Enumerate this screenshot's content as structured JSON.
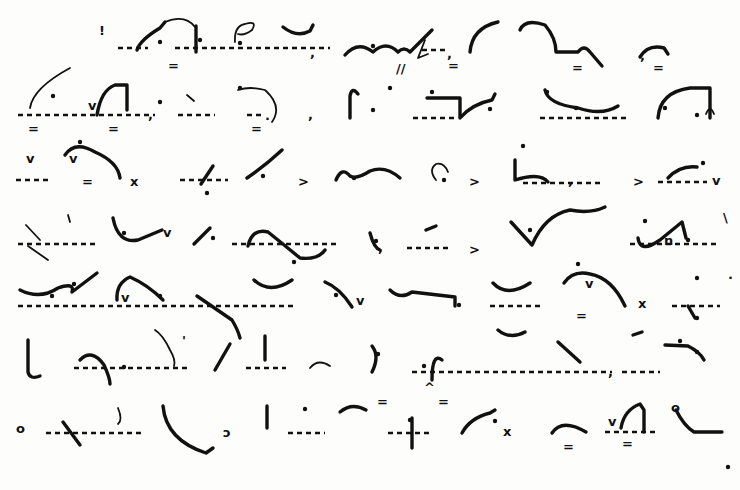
{
  "document": {
    "type": "Pitman shorthand page (scanned)",
    "ink_color": "#111111",
    "paper_color": "#fdfdfc",
    "line_count": 7
  },
  "lines": [
    {
      "id": 1,
      "baselines": [
        [
          118,
          48,
          148,
          48
        ],
        [
          175,
          48,
          330,
          48
        ],
        [
          422,
          50,
          448,
          50
        ]
      ],
      "paths": [
        {
          "d": "M137 50 Q140 40 160 28 L165 22",
          "w": "thick"
        },
        {
          "d": "M165 22 Q185 14 195 27",
          "w": "thin"
        },
        {
          "d": "M196 26 L196 52",
          "w": "thick"
        },
        {
          "d": "M235 42 Q234 26 245 24 Q258 20 252 30 Q244 36 238 34",
          "w": "thin"
        },
        {
          "d": "M283 27 Q297 38 310 31 L313 25",
          "w": "thick"
        },
        {
          "d": "M345 55 Q358 40 373 52 Q386 40 398 52 Q404 46 410 52 L432 30",
          "w": "thick"
        },
        {
          "d": "M425 40 L418 58 L428 54",
          "w": "thin"
        },
        {
          "d": "M470 52 Q472 28 498 22",
          "w": "thick"
        },
        {
          "d": "M520 30 Q525 18 545 25 Q556 38 556 52 L578 52 Q584 44 590 52 L602 66",
          "w": "thick"
        },
        {
          "d": "M640 57 Q648 44 664 48 L668 54",
          "w": "thick"
        }
      ],
      "dots": [
        [
          160,
          42
        ],
        [
          200,
          40
        ],
        [
          240,
          43
        ],
        [
          373,
          46
        ]
      ],
      "marks": [
        {
          "t": "=",
          "x": 168,
          "y": 70
        },
        {
          "t": "//",
          "x": 396,
          "y": 73
        },
        {
          "t": "=",
          "x": 448,
          "y": 70
        },
        {
          "t": "=",
          "x": 572,
          "y": 72
        },
        {
          "t": "=",
          "x": 653,
          "y": 72
        },
        {
          "t": ",",
          "x": 310,
          "y": 57
        },
        {
          "t": ",",
          "x": 447,
          "y": 58
        },
        {
          "t": ",",
          "x": 640,
          "y": 60
        },
        {
          "t": "!",
          "x": 99,
          "y": 35
        }
      ]
    },
    {
      "id": 2,
      "baselines": [
        [
          18,
          115,
          155,
          115
        ],
        [
          178,
          115,
          215,
          115
        ],
        [
          413,
          118,
          456,
          118
        ],
        [
          540,
          118,
          630,
          118
        ],
        [
          247,
          115,
          262,
          115
        ]
      ],
      "paths": [
        {
          "d": "M30 108 Q33 88 70 68",
          "w": "thin"
        },
        {
          "d": "M97 115 Q101 90 115 85 L127 85 L127 110",
          "w": "thick"
        },
        {
          "d": "M187 95 L194 101",
          "w": "thin"
        },
        {
          "d": "M238 90 Q250 86 265 90 Q283 106 272 122",
          "w": "thin"
        },
        {
          "d": "M350 118 L350 96 Q352 86 358 94",
          "w": "thick"
        },
        {
          "d": "M427 98 L460 98 L460 118 Q472 104 492 100 L495 94",
          "w": "thick"
        },
        {
          "d": "M545 90 Q548 104 578 108 Q602 116 618 106",
          "w": "thick"
        },
        {
          "d": "M658 118 Q660 92 690 88 L710 88 L710 118",
          "w": "thick"
        },
        {
          "d": "M706 114 Q710 104 714 114",
          "w": "thin"
        }
      ],
      "dots": [
        [
          53,
          96
        ],
        [
          160,
          102
        ],
        [
          240,
          88
        ],
        [
          373,
          110
        ],
        [
          390,
          88
        ],
        [
          432,
          92
        ],
        [
          490,
          109
        ],
        [
          547,
          92
        ],
        [
          576,
          108
        ],
        [
          665,
          108
        ],
        [
          697,
          115
        ]
      ],
      "marks": [
        {
          "t": "v",
          "x": 88,
          "y": 110
        },
        {
          "t": ",",
          "x": 148,
          "y": 119
        },
        {
          "t": ",",
          "x": 308,
          "y": 119
        },
        {
          "t": "=",
          "x": 28,
          "y": 133
        },
        {
          "t": "=",
          "x": 108,
          "y": 133
        },
        {
          "t": "=",
          "x": 251,
          "y": 133
        },
        {
          "t": ".",
          "x": 265,
          "y": 120
        }
      ]
    },
    {
      "id": 3,
      "baselines": [
        [
          16,
          180,
          48,
          180
        ],
        [
          180,
          180,
          228,
          180
        ],
        [
          523,
          183,
          600,
          183
        ],
        [
          658,
          182,
          707,
          182
        ]
      ],
      "paths": [
        {
          "d": "M65 155 Q75 140 95 152 Q118 162 120 178",
          "w": "thick"
        },
        {
          "d": "M201 184 L213 166",
          "w": "thick"
        },
        {
          "d": "M247 178 Q266 165 282 150",
          "w": "thick"
        },
        {
          "d": "M336 180 Q342 166 350 176 Q356 180 370 171 Q385 165 400 178",
          "w": "thick"
        },
        {
          "d": "M436 180 Q428 170 436 164 Q444 162 448 172",
          "w": "thin"
        },
        {
          "d": "M515 160 L515 180 Q540 172 548 182",
          "w": "thick"
        },
        {
          "d": "M668 178 Q680 165 697 167",
          "w": "thick"
        }
      ],
      "dots": [
        [
          80,
          142
        ],
        [
          207,
          193
        ],
        [
          263,
          176
        ],
        [
          354,
          178
        ],
        [
          444,
          180
        ],
        [
          523,
          146
        ],
        [
          703,
          163
        ]
      ],
      "marks": [
        {
          "t": "v",
          "x": 26,
          "y": 163
        },
        {
          "t": "v",
          "x": 69,
          "y": 163
        },
        {
          "t": "=",
          "x": 82,
          "y": 186
        },
        {
          "t": "x",
          "x": 130,
          "y": 186
        },
        {
          "t": ">",
          "x": 298,
          "y": 186
        },
        {
          "t": ">",
          "x": 469,
          "y": 186
        },
        {
          "t": ",",
          "x": 568,
          "y": 185
        },
        {
          "t": ">",
          "x": 633,
          "y": 186
        },
        {
          "t": "v",
          "x": 712,
          "y": 185
        }
      ]
    },
    {
      "id": 4,
      "baselines": [
        [
          18,
          244,
          98,
          244
        ],
        [
          232,
          244,
          337,
          244
        ],
        [
          407,
          248,
          450,
          248
        ],
        [
          630,
          244,
          720,
          244
        ]
      ],
      "paths": [
        {
          "d": "M28 246 L48 260",
          "w": "thin"
        },
        {
          "d": "M26 225 L40 240",
          "w": "thin"
        },
        {
          "d": "M68 215 L70 222",
          "w": "thin"
        },
        {
          "d": "M113 218 Q118 244 138 240 L162 230",
          "w": "thick"
        },
        {
          "d": "M194 244 L210 228",
          "w": "thick"
        },
        {
          "d": "M248 246 Q252 228 268 232 Q283 244 300 258 Q318 260 325 250",
          "w": "thick"
        },
        {
          "d": "M370 233 Q374 248 380 250",
          "w": "thick"
        },
        {
          "d": "M426 230 L436 226",
          "w": "thick"
        },
        {
          "d": "M511 222 L532 245 Q545 215 570 210 Q590 214 605 207",
          "w": "thick"
        },
        {
          "d": "M638 238 Q640 254 660 240 L682 222 L686 238",
          "w": "thick"
        }
      ],
      "dots": [
        [
          124,
          233
        ],
        [
          213,
          238
        ],
        [
          294,
          262
        ],
        [
          376,
          241
        ],
        [
          530,
          230
        ],
        [
          645,
          221
        ],
        [
          688,
          240
        ]
      ],
      "marks": [
        {
          "t": "v",
          "x": 163,
          "y": 237
        },
        {
          "t": ",",
          "x": 378,
          "y": 252
        },
        {
          "t": ">",
          "x": 469,
          "y": 254
        },
        {
          "t": "\\",
          "x": 723,
          "y": 222
        },
        {
          "t": "n",
          "x": 664,
          "y": 245
        }
      ]
    },
    {
      "id": 5,
      "baselines": [
        [
          18,
          306,
          295,
          306
        ],
        [
          490,
          306,
          540,
          306
        ],
        [
          672,
          306,
          720,
          306
        ]
      ],
      "paths": [
        {
          "d": "M20 290 Q40 300 58 288 Q75 282 72 292 L97 273",
          "w": "thick"
        },
        {
          "d": "M117 300 Q116 283 130 277 Q148 285 163 300",
          "w": "thick"
        },
        {
          "d": "M197 296 L232 320 Q238 330 240 338",
          "w": "thick"
        },
        {
          "d": "M254 280 Q270 295 292 280",
          "w": "thick"
        },
        {
          "d": "M325 282 Q340 288 352 307",
          "w": "thick"
        },
        {
          "d": "M390 290 Q400 300 412 292 L455 297 L455 306",
          "w": "thick"
        },
        {
          "d": "M493 283 Q507 298 530 283",
          "w": "thick"
        },
        {
          "d": "M564 283 Q573 270 590 274 Q612 278 625 306",
          "w": "thick"
        },
        {
          "d": "M688 306 L695 318",
          "w": "thick"
        }
      ],
      "dots": [
        [
          52,
          296
        ],
        [
          74,
          284
        ],
        [
          160,
          296
        ],
        [
          336,
          295
        ],
        [
          459,
          305
        ],
        [
          578,
          264
        ],
        [
          697,
          318
        ],
        [
          697,
          278
        ]
      ],
      "marks": [
        {
          "t": "v",
          "x": 121,
          "y": 302
        },
        {
          "t": "v",
          "x": 356,
          "y": 305
        },
        {
          "t": "v",
          "x": 585,
          "y": 288
        },
        {
          "t": "=",
          "x": 576,
          "y": 320
        },
        {
          "t": "x",
          "x": 638,
          "y": 308
        },
        {
          "t": "·",
          "x": 728,
          "y": 282
        }
      ]
    },
    {
      "id": 6,
      "baselines": [
        [
          74,
          368,
          190,
          368
        ],
        [
          246,
          368,
          286,
          368
        ],
        [
          412,
          372,
          612,
          372
        ],
        [
          622,
          372,
          660,
          372
        ]
      ],
      "paths": [
        {
          "d": "M28 340 L28 372 Q30 380 40 376",
          "w": "thick"
        },
        {
          "d": "M80 360 Q92 348 104 365 Q110 378 110 384",
          "w": "thick"
        },
        {
          "d": "M155 330 Q163 335 170 350 Q176 360 174 366",
          "w": "thin"
        },
        {
          "d": "M215 370 L230 344",
          "w": "thick"
        },
        {
          "d": "M265 336 L265 360",
          "w": "thick"
        },
        {
          "d": "M310 368 Q318 358 330 366",
          "w": "thin"
        },
        {
          "d": "M372 346 Q380 356 372 372",
          "w": "thick"
        },
        {
          "d": "M432 380 Q432 352 442 360",
          "w": "thick"
        },
        {
          "d": "M498 330 Q510 340 525 332",
          "w": "thick"
        },
        {
          "d": "M558 342 L580 362",
          "w": "thick"
        },
        {
          "d": "M633 335 L642 332",
          "w": "thick"
        },
        {
          "d": "M665 345 L688 346 Q700 352 704 360",
          "w": "thick"
        }
      ],
      "dots": [
        [
          124,
          367
        ],
        [
          378,
          354
        ],
        [
          424,
          366
        ],
        [
          680,
          341
        ],
        [
          697,
          352
        ]
      ],
      "marks": [
        {
          "t": "'",
          "x": 182,
          "y": 345
        },
        {
          "t": ",",
          "x": 608,
          "y": 376
        },
        {
          "t": "=",
          "x": 377,
          "y": 406
        },
        {
          "t": "=",
          "x": 438,
          "y": 406
        },
        {
          "t": "^",
          "x": 424,
          "y": 392
        }
      ]
    },
    {
      "id": 7,
      "baselines": [
        [
          46,
          433,
          144,
          433
        ],
        [
          288,
          433,
          325,
          433
        ],
        [
          388,
          433,
          430,
          433
        ],
        [
          605,
          432,
          655,
          432
        ]
      ],
      "paths": [
        {
          "d": "M63 422 L80 445",
          "w": "thick"
        },
        {
          "d": "M118 408 Q123 420 118 424",
          "w": "thin"
        },
        {
          "d": "M163 406 Q166 440 206 453 L213 448",
          "w": "thick"
        },
        {
          "d": "M267 428 L267 406",
          "w": "thick"
        },
        {
          "d": "M340 412 Q352 402 366 410",
          "w": "thick"
        },
        {
          "d": "M412 418 L412 448",
          "w": "thick"
        },
        {
          "d": "M462 433 Q470 418 490 413 L495 410",
          "w": "thick"
        },
        {
          "d": "M552 433 Q562 418 586 432",
          "w": "thick"
        },
        {
          "d": "M621 428 Q624 410 640 404 L644 410 L644 432",
          "w": "thick"
        },
        {
          "d": "M676 410 Q684 426 694 432 L722 432",
          "w": "thick"
        }
      ],
      "dots": [
        [
          305,
          409
        ],
        [
          410,
          420
        ],
        [
          495,
          421
        ],
        [
          728,
          467
        ]
      ],
      "marks": [
        {
          "t": "o",
          "x": 16,
          "y": 433
        },
        {
          "t": "ɔ",
          "x": 223,
          "y": 437
        },
        {
          "t": "x",
          "x": 503,
          "y": 436
        },
        {
          "t": "=",
          "x": 563,
          "y": 451
        },
        {
          "t": "=",
          "x": 622,
          "y": 448
        },
        {
          "t": "v",
          "x": 608,
          "y": 426
        },
        {
          "t": "o",
          "x": 671,
          "y": 412
        }
      ]
    }
  ]
}
